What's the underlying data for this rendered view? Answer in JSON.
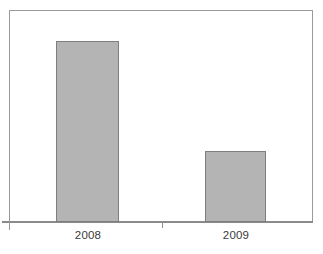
{
  "chart_data": {
    "type": "bar",
    "title": "",
    "subtitle": "",
    "xlabel": "",
    "ylabel": "",
    "categories": [
      "2008",
      "2009"
    ],
    "values": [
      181,
      71
    ],
    "value_unit": "px-height (unlabeled axis)",
    "series": [
      {
        "name": "",
        "values": [
          181,
          71
        ]
      }
    ],
    "ylim": [
      0,
      212
    ],
    "grid": false,
    "legend": false,
    "legend_position": "none",
    "axis_tick_labels_x": [
      "2008",
      "2009"
    ],
    "axis_tick_labels_y": [],
    "annotations": []
  },
  "chart": {
    "bars": [
      {
        "category": "2008",
        "label": "2008",
        "left_px": 56,
        "width_px": 63,
        "top_px": 41,
        "height_px": 181,
        "label_center_px": 88
      },
      {
        "category": "2009",
        "label": "2009",
        "left_px": 205,
        "width_px": 61,
        "top_px": 151,
        "height_px": 71,
        "label_center_px": 236
      }
    ],
    "ticks": [
      {
        "x_px": 162
      }
    ]
  },
  "colors": {
    "bar_fill": "#b4b4b4",
    "bar_stroke": "#7e7e7e",
    "frame_stroke": "#9a9a9a",
    "axis_stroke": "#8a8a8a",
    "tick_stroke": "#8f8f8f",
    "label_text": "#3a3a3a",
    "background": "#ffffff"
  }
}
